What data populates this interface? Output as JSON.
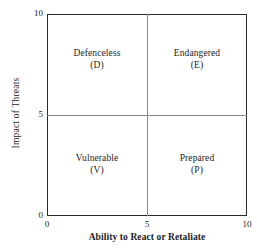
{
  "chart_data": {
    "type": "scatter",
    "title": "",
    "subtitle": "",
    "xlabel": "Ability to React or Retaliate",
    "ylabel": "Impact of Threats",
    "xlim": [
      0,
      10
    ],
    "ylim": [
      0,
      10
    ],
    "xticks": [
      "0",
      "5",
      "10"
    ],
    "yticks": [
      "0",
      "5",
      "10"
    ],
    "grid": false,
    "legend": "none",
    "divider_x": 5,
    "divider_y": 5,
    "series": [],
    "annotations": [
      {
        "name": "Defenceless",
        "code": "(D)",
        "quadrant": "top-left",
        "x_range": [
          0,
          5
        ],
        "y_range": [
          5,
          10
        ]
      },
      {
        "name": "Endangered",
        "code": "(E)",
        "quadrant": "top-right",
        "x_range": [
          5,
          10
        ],
        "y_range": [
          5,
          10
        ]
      },
      {
        "name": "Vulnerable",
        "code": "(V)",
        "quadrant": "bottom-left",
        "x_range": [
          0,
          5
        ],
        "y_range": [
          0,
          5
        ]
      },
      {
        "name": "Prepared",
        "code": "(P)",
        "quadrant": "bottom-right",
        "x_range": [
          5,
          10
        ],
        "y_range": [
          0,
          5
        ]
      }
    ],
    "colors": {
      "frame": "#2b2b2b",
      "divider": "#8a8a8a",
      "text": "#232323",
      "background": "#ffffff"
    }
  },
  "axes": {
    "y": {
      "title": "Impact of Threats",
      "ticks": {
        "top": "10",
        "middle": "5",
        "bottom": "0"
      }
    },
    "x": {
      "title": "Ability to React or Retaliate",
      "ticks": {
        "left": "0",
        "middle": "5",
        "right": "10"
      }
    }
  },
  "quadrants": {
    "top_left": {
      "name": "Defenceless",
      "code": "(D)"
    },
    "top_right": {
      "name": "Endangered",
      "code": "(E)"
    },
    "bottom_left": {
      "name": "Vulnerable",
      "code": "(V)"
    },
    "bottom_right": {
      "name": "Prepared",
      "code": "(P)"
    }
  }
}
